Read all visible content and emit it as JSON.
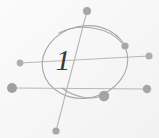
{
  "figure": {
    "background_color": "#f7f7f7",
    "width": 159,
    "height": 138,
    "label": "1",
    "label_x": 63,
    "label_y": 70,
    "label_size": 30,
    "label_color": "#3a3a3a",
    "stroke_color": "#b8b8b8",
    "stroke_color_dark": "#a8a8a8",
    "node_color": "#a9a9a9",
    "node_color_light": "#bcbcbc"
  },
  "circle": {
    "name": "vertex-circle",
    "cx": 85,
    "cy": 62,
    "rx": 43,
    "ry": 36,
    "rotation": -12,
    "stroke_width": 1.1
  },
  "edges": [
    {
      "name": "edge-top-to-bottom",
      "x1": 87,
      "y1": 11,
      "x2": 56,
      "y2": 131,
      "stroke_width": 1.1
    },
    {
      "name": "edge-left-upper-to-right-upper",
      "x1": 20,
      "y1": 63,
      "x2": 149,
      "y2": 56,
      "stroke_width": 1.0
    },
    {
      "name": "edge-left-lower-to-right-lower",
      "x1": 12,
      "y1": 88,
      "x2": 147,
      "y2": 89,
      "stroke_width": 1.0
    }
  ],
  "arcs": [
    {
      "name": "arc-upper-right",
      "path": "M 59,33 C 80,22 110,28 122,43",
      "stroke_width": 1.1
    },
    {
      "name": "arc-lower-right",
      "path": "M 62,88 C 75,98 92,100 101,96",
      "stroke_width": 1.1
    }
  ],
  "nodes": [
    {
      "name": "node-top",
      "cx": 87,
      "cy": 11,
      "r": 4.0,
      "color": "#a6a6a6"
    },
    {
      "name": "node-bottom",
      "cx": 56,
      "cy": 131,
      "r": 3.6,
      "color": "#a6a6a6"
    },
    {
      "name": "node-left-upper",
      "cx": 20,
      "cy": 63,
      "r": 3.4,
      "color": "#b0b0b0"
    },
    {
      "name": "node-left-lower",
      "cx": 12,
      "cy": 88,
      "r": 5.0,
      "color": "#a0a0a0"
    },
    {
      "name": "node-right-upper",
      "cx": 149,
      "cy": 56,
      "r": 3.6,
      "color": "#aeaeae"
    },
    {
      "name": "node-right-lower",
      "cx": 147,
      "cy": 89,
      "r": 4.2,
      "color": "#a6a6a6"
    },
    {
      "name": "node-arc-upper-end",
      "cx": 125,
      "cy": 46,
      "r": 3.6,
      "color": "#a8a8a8"
    },
    {
      "name": "node-arc-lower-end",
      "cx": 104,
      "cy": 96,
      "r": 5.2,
      "color": "#a4a4a4"
    }
  ]
}
